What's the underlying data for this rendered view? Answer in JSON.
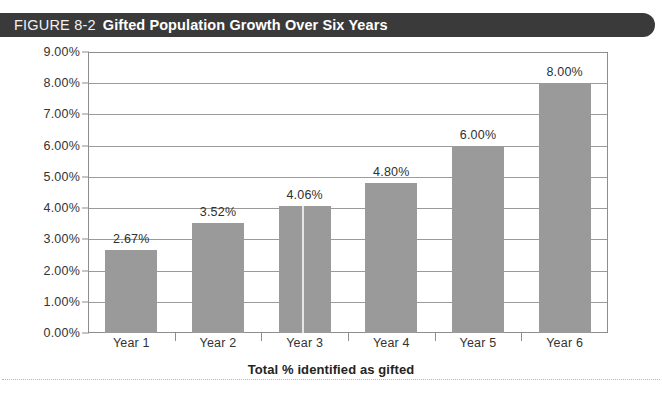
{
  "header": {
    "figure_number": "FIGURE 8-2",
    "title": "Gifted Population Growth Over Six Years",
    "bar_color": "#3a3a3a",
    "text_color": "#ffffff"
  },
  "chart_data": {
    "type": "bar",
    "title": "Gifted Population Growth Over Six Years",
    "categories": [
      "Year 1",
      "Year 2",
      "Year 3",
      "Year 4",
      "Year 5",
      "Year 6"
    ],
    "values": [
      2.67,
      3.52,
      4.06,
      4.8,
      6.0,
      8.0
    ],
    "value_labels": [
      "2.67%",
      "3.52%",
      "4.06%",
      "4.80%",
      "6.00%",
      "8.00%"
    ],
    "xlabel": "Total % identified as gifted",
    "ylabel": "",
    "ylim": [
      0,
      9
    ],
    "ytick_labels": [
      "0.00%",
      "1.00%",
      "2.00%",
      "3.00%",
      "4.00%",
      "5.00%",
      "6.00%",
      "7.00%",
      "8.00%",
      "9.00%"
    ],
    "ytick_values": [
      0,
      1,
      2,
      3,
      4,
      5,
      6,
      7,
      8,
      9
    ],
    "grid": true,
    "legend": "none",
    "bar_color": "#9a9a9a",
    "gridline_color": "#9b9b9b",
    "axis_color": "#8d8d8d",
    "background": "#ffffff"
  }
}
